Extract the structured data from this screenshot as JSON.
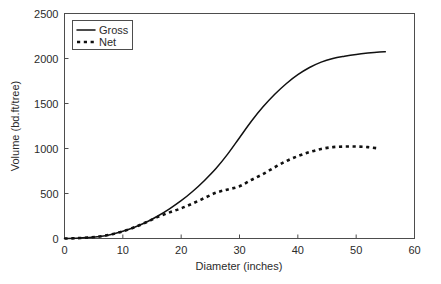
{
  "chart_data": {
    "type": "line",
    "title": "",
    "xlabel": "Diameter (inches)",
    "ylabel": "Volume (bd.ft/tree)",
    "xlim": [
      0,
      60
    ],
    "ylim": [
      0,
      2500
    ],
    "xticks": [
      0,
      10,
      20,
      30,
      40,
      50,
      60
    ],
    "yticks": [
      0,
      500,
      1000,
      1500,
      2000,
      2500
    ],
    "xtick_labels": [
      "0",
      "10",
      "20",
      "30",
      "40",
      "50",
      "60"
    ],
    "ytick_labels": [
      "0",
      "500",
      "1000",
      "1500",
      "2000",
      "2500"
    ],
    "grid": false,
    "legend_position": "upper left",
    "series": [
      {
        "name": "Gross",
        "style": "solid",
        "color": "#111111",
        "x": [
          0,
          2,
          4,
          6,
          8,
          10,
          12,
          14,
          16,
          18,
          20,
          22,
          24,
          26,
          28,
          30,
          32,
          34,
          36,
          38,
          40,
          42,
          44,
          46,
          48,
          50,
          52,
          54,
          55
        ],
        "values": [
          0,
          3,
          10,
          22,
          45,
          80,
          125,
          180,
          250,
          330,
          420,
          525,
          645,
          780,
          940,
          1120,
          1300,
          1460,
          1600,
          1720,
          1820,
          1900,
          1960,
          2000,
          2025,
          2045,
          2060,
          2072,
          2075
        ]
      },
      {
        "name": "Net",
        "style": "dashed",
        "color": "#111111",
        "x": [
          0,
          2,
          4,
          6,
          8,
          10,
          12,
          14,
          16,
          18,
          20,
          22,
          24,
          26,
          28,
          30,
          32,
          34,
          36,
          38,
          40,
          42,
          44,
          46,
          48,
          50,
          52,
          54
        ],
        "values": [
          0,
          3,
          10,
          22,
          45,
          80,
          125,
          180,
          240,
          290,
          335,
          390,
          450,
          510,
          545,
          580,
          650,
          715,
          790,
          860,
          915,
          960,
          995,
          1015,
          1022,
          1022,
          1015,
          1000
        ]
      }
    ]
  },
  "legend": {
    "items": [
      {
        "label": "Gross",
        "style": "solid"
      },
      {
        "label": "Net",
        "style": "dashed"
      }
    ]
  }
}
